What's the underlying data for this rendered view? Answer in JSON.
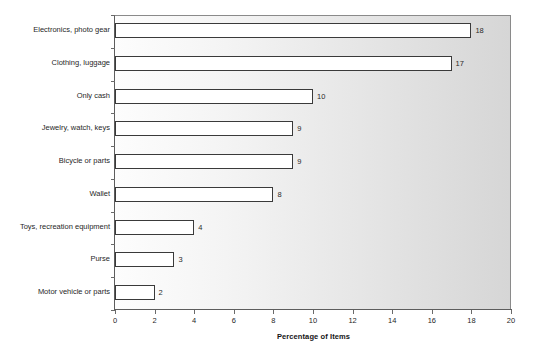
{
  "chart_data": {
    "type": "bar",
    "orientation": "horizontal",
    "title": "",
    "xlabel": "Percentage of Items",
    "ylabel": "",
    "xlim": [
      0,
      20
    ],
    "xticks": [
      0,
      2,
      4,
      6,
      8,
      10,
      12,
      14,
      16,
      18,
      20
    ],
    "grid": false,
    "legend": null,
    "categories": [
      "Electronics, photo gear",
      "Clothing, luggage",
      "Only cash",
      "Jewelry, watch, keys",
      "Bicycle or parts",
      "Wallet",
      "Toys, recreation equipment",
      "Purse",
      "Motor vehicle or parts"
    ],
    "values": [
      18,
      17,
      10,
      9,
      9,
      8,
      4,
      3,
      2
    ],
    "value_labels": [
      "18",
      "17",
      "10",
      "9",
      "9",
      "8",
      "4",
      "3",
      "2"
    ],
    "bar_fill_color": "#ffffff",
    "bar_edge_color": "#3a3a3a",
    "plot_background_start": "#fdfdfd",
    "plot_background_end": "#d6d6d6"
  }
}
